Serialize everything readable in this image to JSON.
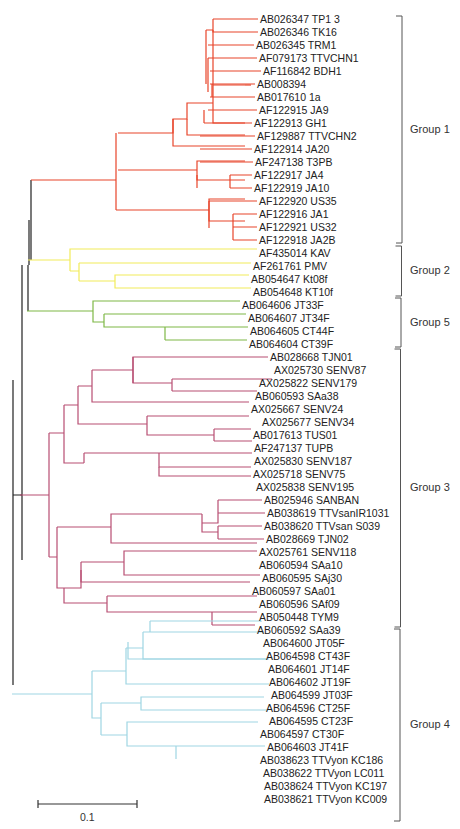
{
  "figure": {
    "title": "",
    "scale_bar": {
      "label": "0.1"
    }
  },
  "colors": {
    "group1": "#e8452a",
    "group2": "#f2ec5a",
    "group5": "#7fb846",
    "group3": "#b84e72",
    "group4": "#9fd6e3",
    "backbone": "#222222",
    "bracket": "#555555"
  },
  "groups": [
    {
      "id": "group1",
      "label": "Group 1",
      "y_start": 16,
      "y_end": 243
    },
    {
      "id": "group2",
      "label": "Group 2",
      "y_start": 246,
      "y_end": 296
    },
    {
      "id": "group5",
      "label": "Group 5",
      "y_start": 298,
      "y_end": 347
    },
    {
      "id": "group3",
      "label": "Group 3",
      "y_start": 349,
      "y_end": 627
    },
    {
      "id": "group4",
      "label": "Group 4",
      "y_start": 629,
      "y_end": 821
    }
  ],
  "leaves": [
    {
      "label": "AB026347 TP1 3",
      "group": "group1",
      "x": 258,
      "y": 19
    },
    {
      "label": "AB026346 TK16",
      "group": "group1",
      "x": 258,
      "y": 32
    },
    {
      "label": "AB026345 TRM1",
      "group": "group1",
      "x": 254,
      "y": 45
    },
    {
      "label": "AF079173 TTVCHN1",
      "group": "group1",
      "x": 257,
      "y": 58
    },
    {
      "label": "AF116842 BDH1",
      "group": "group1",
      "x": 261,
      "y": 71
    },
    {
      "label": "AB008394",
      "group": "group1",
      "x": 255,
      "y": 84
    },
    {
      "label": "AB017610 1a",
      "group": "group1",
      "x": 255,
      "y": 97
    },
    {
      "label": "AF122915 JA9",
      "group": "group1",
      "x": 257,
      "y": 110
    },
    {
      "label": "AF122913 GH1",
      "group": "group1",
      "x": 252,
      "y": 123
    },
    {
      "label": "AF129887 TTVCHN2",
      "group": "group1",
      "x": 255,
      "y": 136
    },
    {
      "label": "AF122914 JA20",
      "group": "group1",
      "x": 252,
      "y": 149
    },
    {
      "label": "AF247138 T3PB",
      "group": "group1",
      "x": 253,
      "y": 162
    },
    {
      "label": "AF122917 JA4",
      "group": "group1",
      "x": 252,
      "y": 175
    },
    {
      "label": "AF122919 JA10",
      "group": "group1",
      "x": 252,
      "y": 188
    },
    {
      "label": "AF122920 US35",
      "group": "group1",
      "x": 257,
      "y": 201
    },
    {
      "label": "AF122916 JA1",
      "group": "group1",
      "x": 257,
      "y": 214
    },
    {
      "label": "AF122921 US32",
      "group": "group1",
      "x": 257,
      "y": 227
    },
    {
      "label": "AF122918 JA2B",
      "group": "group1",
      "x": 257,
      "y": 240
    },
    {
      "label": "AF435014 KAV",
      "group": "group2",
      "x": 257,
      "y": 253
    },
    {
      "label": "AF261761 PMV",
      "group": "group2",
      "x": 251,
      "y": 266
    },
    {
      "label": "AB054647 Kt08f",
      "group": "group2",
      "x": 249,
      "y": 279
    },
    {
      "label": "AB054648 KT10f",
      "group": "group2",
      "x": 251,
      "y": 292
    },
    {
      "label": "AB064606 JT33F",
      "group": "group5",
      "x": 240,
      "y": 305
    },
    {
      "label": "AB064607 JT34F",
      "group": "group5",
      "x": 246,
      "y": 318
    },
    {
      "label": "AB064605 CT44F",
      "group": "group5",
      "x": 248,
      "y": 331
    },
    {
      "label": "AB064604 CT39F",
      "group": "group5",
      "x": 247,
      "y": 344
    },
    {
      "label": "AB028668 TJN01",
      "group": "group3",
      "x": 268,
      "y": 357
    },
    {
      "label": "AX025730 SENV87",
      "group": "group3",
      "x": 272,
      "y": 370
    },
    {
      "label": "AX025822 SENV179",
      "group": "group3",
      "x": 257,
      "y": 383
    },
    {
      "label": "AB060593 SAa38",
      "group": "group3",
      "x": 253,
      "y": 396
    },
    {
      "label": "AX025667 SENV24",
      "group": "group3",
      "x": 249,
      "y": 409
    },
    {
      "label": "AX025677 SENV34",
      "group": "group3",
      "x": 260,
      "y": 422
    },
    {
      "label": "AB017613 TUS01",
      "group": "group3",
      "x": 251,
      "y": 435
    },
    {
      "label": "AF247137 TUPB",
      "group": "group3",
      "x": 252,
      "y": 448
    },
    {
      "label": "AX025830 SENV187",
      "group": "group3",
      "x": 252,
      "y": 461
    },
    {
      "label": "AX025718 SENV75",
      "group": "group3",
      "x": 251,
      "y": 474
    },
    {
      "label": "AX025838 SENV195",
      "group": "group3",
      "x": 254,
      "y": 487
    },
    {
      "label": "AB025946 SANBAN",
      "group": "group3",
      "x": 262,
      "y": 500
    },
    {
      "label": "AB038619 TTVsanIR1031",
      "group": "group3",
      "x": 265,
      "y": 513
    },
    {
      "label": "AB038620 TTVsan S039",
      "group": "group3",
      "x": 262,
      "y": 526
    },
    {
      "label": "AB028669 TJN02",
      "group": "group3",
      "x": 264,
      "y": 539
    },
    {
      "label": "AX025761 SENV118",
      "group": "group3",
      "x": 257,
      "y": 552
    },
    {
      "label": "AB060594 SAa10",
      "group": "group3",
      "x": 257,
      "y": 565
    },
    {
      "label": "AB060595 SAj30",
      "group": "group3",
      "x": 260,
      "y": 578
    },
    {
      "label": "AB060597 SAa01",
      "group": "group3",
      "x": 250,
      "y": 591
    },
    {
      "label": "AB060596 SAf09",
      "group": "group3",
      "x": 257,
      "y": 604
    },
    {
      "label": "AB050448 TYM9",
      "group": "group3",
      "x": 257,
      "y": 617
    },
    {
      "label": "AB060592 SAa39",
      "group": "group3",
      "x": 255,
      "y": 630
    },
    {
      "label": "AB064600 JT05F",
      "group": "group4",
      "x": 261,
      "y": 643
    },
    {
      "label": "AB064598 CT43F",
      "group": "group4",
      "x": 264,
      "y": 656
    },
    {
      "label": "AB064601 JT14F",
      "group": "group4",
      "x": 266,
      "y": 669
    },
    {
      "label": "AB064602 JT19F",
      "group": "group4",
      "x": 267,
      "y": 682
    },
    {
      "label": "AB064599 JT03F",
      "group": "group4",
      "x": 269,
      "y": 695
    },
    {
      "label": "AB064596 CT25F",
      "group": "group4",
      "x": 264,
      "y": 708
    },
    {
      "label": "AB064595 CT23F",
      "group": "group4",
      "x": 267,
      "y": 721
    },
    {
      "label": "AB064597 CT30F",
      "group": "group4",
      "x": 258,
      "y": 734
    },
    {
      "label": "AB064603 JT41F",
      "group": "group4",
      "x": 265,
      "y": 747
    },
    {
      "label": "AB038623 TTVyon KC186",
      "group": "group4",
      "x": 258,
      "y": 760
    },
    {
      "label": "AB038622 TTVyon LC011",
      "group": "group4",
      "x": 261,
      "y": 773
    },
    {
      "label": "AB038624 TTVyon KC197",
      "group": "group4",
      "x": 262,
      "y": 786
    },
    {
      "label": "AB038621 TTVyon KC009",
      "group": "group4",
      "x": 262,
      "y": 799
    }
  ]
}
